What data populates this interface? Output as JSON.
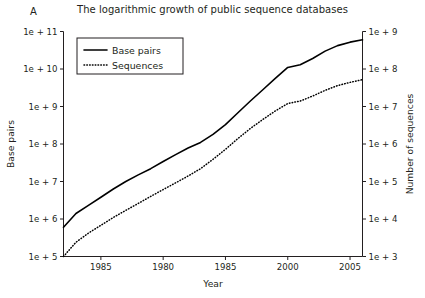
{
  "figure": {
    "panel_label": "A",
    "title": "The logarithmic growth of public sequence databases"
  },
  "chart_data": {
    "type": "line",
    "title": "The logarithmic growth of public sequence databases",
    "xlabel": "Year",
    "ylabel": "Base pairs",
    "y2label": "Number of sequences",
    "grid": false,
    "legend_position": "top-left",
    "xlim": [
      1982,
      2006
    ],
    "xticks": [
      1985,
      1990,
      1995,
      2000,
      2005
    ],
    "xtick_labels": [
      "1985",
      "1980",
      "1985",
      "2000",
      "2005"
    ],
    "yscale": "log",
    "ylim": [
      100000,
      100000000000
    ],
    "yticks": [
      100000,
      1000000,
      10000000,
      100000000,
      1000000000,
      10000000000,
      100000000000
    ],
    "ytick_labels": [
      "1e + 5",
      "1e + 6",
      "1e + 7",
      "1e + 8",
      "1e + 9",
      "1e + 10",
      "1e + 11"
    ],
    "y2scale": "log",
    "y2lim": [
      1000,
      1000000000
    ],
    "y2ticks": [
      1000,
      10000,
      100000,
      1000000,
      10000000,
      100000000,
      1000000000
    ],
    "y2tick_labels": [
      "1e + 3",
      "1e + 4",
      "1e + 5",
      "1e + 6",
      "1e + 7",
      "1e + 8",
      "1e + 9"
    ],
    "series": [
      {
        "name": "Base pairs",
        "style": "solid",
        "axis": "left",
        "x": [
          1982,
          1983,
          1984,
          1985,
          1986,
          1987,
          1988,
          1989,
          1990,
          1991,
          1992,
          1993,
          1994,
          1995,
          1996,
          1997,
          1998,
          1999,
          2000,
          2001,
          2002,
          2003,
          2004,
          2005,
          2006
        ],
        "y": [
          600000,
          1400000,
          2300000,
          3800000,
          6300000,
          10000000,
          15000000,
          22000000,
          34000000,
          52000000,
          78000000,
          110000000,
          180000000,
          330000000,
          680000000,
          1400000000,
          2800000000,
          5600000000,
          11000000000,
          13000000000,
          19000000000,
          30000000000,
          42000000000,
          52000000000,
          60000000000
        ]
      },
      {
        "name": "Sequences",
        "style": "dotted",
        "axis": "right",
        "x": [
          1982,
          1983,
          1984,
          1985,
          1986,
          1987,
          1988,
          1989,
          1990,
          1991,
          1992,
          1993,
          1994,
          1995,
          1996,
          1997,
          1998,
          1999,
          2000,
          2001,
          2002,
          2003,
          2004,
          2005,
          2006
        ],
        "y": [
          1000,
          2400,
          4200,
          6800,
          11000,
          17000,
          26000,
          40000,
          61000,
          92000,
          140000,
          220000,
          390000,
          720000,
          1400000,
          2600000,
          4500000,
          7600000,
          12000000,
          14000000,
          19000000,
          27000000,
          36000000,
          44000000,
          52000000
        ]
      }
    ],
    "legend": [
      {
        "label": "Base pairs",
        "style": "solid"
      },
      {
        "label": "Sequences",
        "style": "dotted"
      }
    ]
  }
}
